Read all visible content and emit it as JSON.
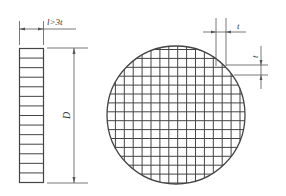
{
  "diagram": {
    "side_view": {
      "thickness_label": "l>3t",
      "diameter_label": "D",
      "rows": 14
    },
    "front_view": {
      "shape": "circle with square grid",
      "grid_pitch_label_horizontal": "t",
      "grid_pitch_label_vertical": "t"
    },
    "colors": {
      "line": "#444444",
      "background": "#ffffff"
    }
  }
}
